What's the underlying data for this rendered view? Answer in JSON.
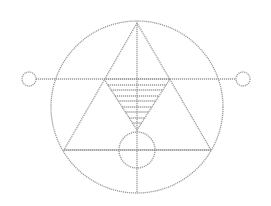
{
  "diagram": {
    "stroke_color": "#9a9a9a",
    "background": "#ffffff",
    "outer_circle": {
      "cx": 137,
      "cy": 107,
      "r": 86
    },
    "side_circles": [
      {
        "cx": 29,
        "cy": 79,
        "r": 7
      },
      {
        "cx": 243,
        "cy": 79,
        "r": 7
      }
    ],
    "inner_circle": {
      "cx": 137,
      "cy": 150,
      "r": 18
    },
    "triangle": {
      "points": "137,23 64,150 211,150"
    },
    "inverted_triangle": {
      "points": "104,79 170,79 137,130"
    },
    "horizontal_line": {
      "x1": 36,
      "y1": 79,
      "x2": 236,
      "y2": 79
    },
    "base_line": {
      "x1": 64,
      "y1": 150,
      "x2": 211,
      "y2": 150
    },
    "vertical_line": {
      "x1": 137,
      "y1": 23,
      "x2": 137,
      "y2": 193
    },
    "hatch_lines_y": [
      85,
      90,
      96,
      101,
      107,
      112,
      118,
      123
    ]
  }
}
